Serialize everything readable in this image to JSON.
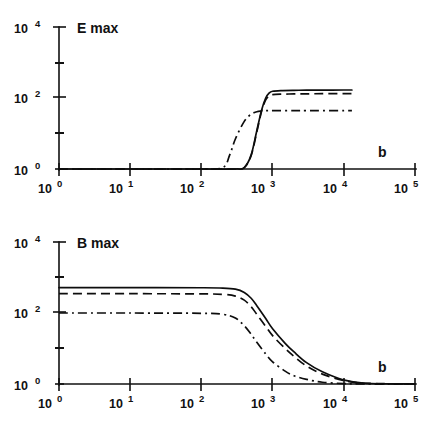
{
  "figure": {
    "background_color": "#ffffff",
    "ink_color": "#111111"
  },
  "chart_data": [
    {
      "type": "line",
      "title": "E max",
      "xlabel": "b",
      "ylabel": "E max",
      "xscale": "log",
      "yscale": "log",
      "xlim": [
        1,
        100000
      ],
      "ylim": [
        1,
        10000
      ],
      "grid": false,
      "legend": "none",
      "xticks": [
        1,
        10,
        100,
        1000,
        10000,
        100000
      ],
      "xticklabels": [
        "10 0",
        "10 1",
        "10 2",
        "10 3",
        "10 4",
        "10 5"
      ],
      "xtick_bases": [
        "10",
        "10",
        "10",
        "10",
        "10",
        "10"
      ],
      "xtick_exponents": [
        "0",
        "1",
        "2",
        "3",
        "4",
        "5"
      ],
      "yticks": [
        1,
        100,
        10000
      ],
      "yticklabels": [
        "10 0",
        "10 2",
        "10 4"
      ],
      "ytick_bases": [
        "10",
        "10",
        "10"
      ],
      "ytick_exponents": [
        "0",
        "2",
        "4"
      ],
      "yminor_ticks": [
        10,
        1000
      ],
      "series": [
        {
          "name": "solid",
          "style": "solid",
          "x": [
            1,
            10,
            100,
            300,
            400,
            500,
            600,
            700,
            800,
            900,
            1000,
            1300,
            2000,
            3000,
            5000,
            10000,
            13000
          ],
          "y": [
            1,
            1,
            1,
            1,
            1.1,
            2.5,
            12,
            45,
            100,
            140,
            155,
            162,
            165,
            166,
            167,
            168,
            168
          ]
        },
        {
          "name": "dashed",
          "style": "dashed",
          "x": [
            1,
            10,
            100,
            300,
            400,
            500,
            600,
            700,
            800,
            900,
            1000,
            1300,
            2000,
            3000,
            5000,
            10000,
            13000
          ],
          "y": [
            1,
            1,
            1,
            1,
            1.1,
            2.4,
            11,
            42,
            88,
            115,
            124,
            128,
            130,
            131,
            132,
            132,
            132
          ]
        },
        {
          "name": "dash-dot",
          "style": "dash-dot",
          "x": [
            1,
            10,
            100,
            200,
            250,
            300,
            400,
            500,
            600,
            700,
            800,
            1000,
            2000,
            3000,
            5000,
            10000,
            13000
          ],
          "y": [
            1,
            1,
            1,
            1.1,
            2.5,
            7,
            22,
            35,
            41,
            43,
            44,
            44,
            44,
            44,
            44,
            44,
            44
          ]
        }
      ]
    },
    {
      "type": "line",
      "title": "B max",
      "xlabel": "b",
      "ylabel": "B max",
      "xscale": "log",
      "yscale": "log",
      "xlim": [
        1,
        100000
      ],
      "ylim": [
        1,
        10000
      ],
      "grid": false,
      "legend": "none",
      "xticks": [
        1,
        10,
        100,
        1000,
        10000,
        100000
      ],
      "xticklabels": [
        "10 0",
        "10 1",
        "10 2",
        "10 3",
        "10 4",
        "10 5"
      ],
      "xtick_bases": [
        "10",
        "10",
        "10",
        "10",
        "10",
        "10"
      ],
      "xtick_exponents": [
        "0",
        "1",
        "2",
        "3",
        "4",
        "5"
      ],
      "yticks": [
        1,
        100,
        10000
      ],
      "yticklabels": [
        "10 0",
        "10 2",
        "10 4"
      ],
      "ytick_bases": [
        "10",
        "10",
        "10"
      ],
      "ytick_exponents": [
        "0",
        "2",
        "4"
      ],
      "yminor_ticks": [
        10,
        1000
      ],
      "series": [
        {
          "name": "solid",
          "style": "solid",
          "x": [
            1,
            10,
            100,
            200,
            300,
            400,
            500,
            600,
            800,
            1000,
            1500,
            2000,
            3000,
            5000,
            10000,
            20000,
            100000
          ],
          "y": [
            520,
            520,
            515,
            505,
            470,
            380,
            260,
            160,
            70,
            36,
            14,
            8,
            4,
            2.2,
            1.3,
            1.05,
            1
          ]
        },
        {
          "name": "dashed",
          "style": "dashed",
          "x": [
            1,
            10,
            100,
            200,
            300,
            400,
            500,
            600,
            800,
            1000,
            1500,
            2000,
            3000,
            5000,
            10000,
            20000,
            100000
          ],
          "y": [
            350,
            350,
            345,
            335,
            300,
            230,
            150,
            92,
            42,
            23,
            10,
            6,
            3.2,
            1.9,
            1.25,
            1.05,
            1
          ]
        },
        {
          "name": "dash-dot",
          "style": "dash-dot",
          "x": [
            1,
            10,
            100,
            200,
            300,
            400,
            500,
            600,
            800,
            1000,
            1500,
            2000,
            3000,
            5000,
            10000,
            20000,
            100000
          ],
          "y": [
            100,
            100,
            98,
            92,
            72,
            44,
            25,
            15,
            7,
            4.2,
            2.3,
            1.7,
            1.35,
            1.12,
            1.03,
            1.0,
            1
          ]
        }
      ]
    }
  ],
  "top_panel": {
    "name": "E-max-panel",
    "variable_label": "E max",
    "x_axis_label": "b",
    "y_tick_labels": [
      {
        "base": "10",
        "exp": "4"
      },
      {
        "base": "10",
        "exp": "2"
      },
      {
        "base": "10",
        "exp": "0"
      }
    ],
    "x_tick_labels": [
      {
        "base": "10",
        "exp": "0"
      },
      {
        "base": "10",
        "exp": "1"
      },
      {
        "base": "10",
        "exp": "2"
      },
      {
        "base": "10",
        "exp": "3"
      },
      {
        "base": "10",
        "exp": "4"
      },
      {
        "base": "10",
        "exp": "5"
      }
    ]
  },
  "bottom_panel": {
    "name": "B-max-panel",
    "variable_label": "B max",
    "x_axis_label": "b",
    "y_tick_labels": [
      {
        "base": "10",
        "exp": "4"
      },
      {
        "base": "10",
        "exp": "2"
      },
      {
        "base": "10",
        "exp": "0"
      }
    ],
    "x_tick_labels": [
      {
        "base": "10",
        "exp": "0"
      },
      {
        "base": "10",
        "exp": "1"
      },
      {
        "base": "10",
        "exp": "2"
      },
      {
        "base": "10",
        "exp": "3"
      },
      {
        "base": "10",
        "exp": "4"
      },
      {
        "base": "10",
        "exp": "5"
      }
    ]
  }
}
